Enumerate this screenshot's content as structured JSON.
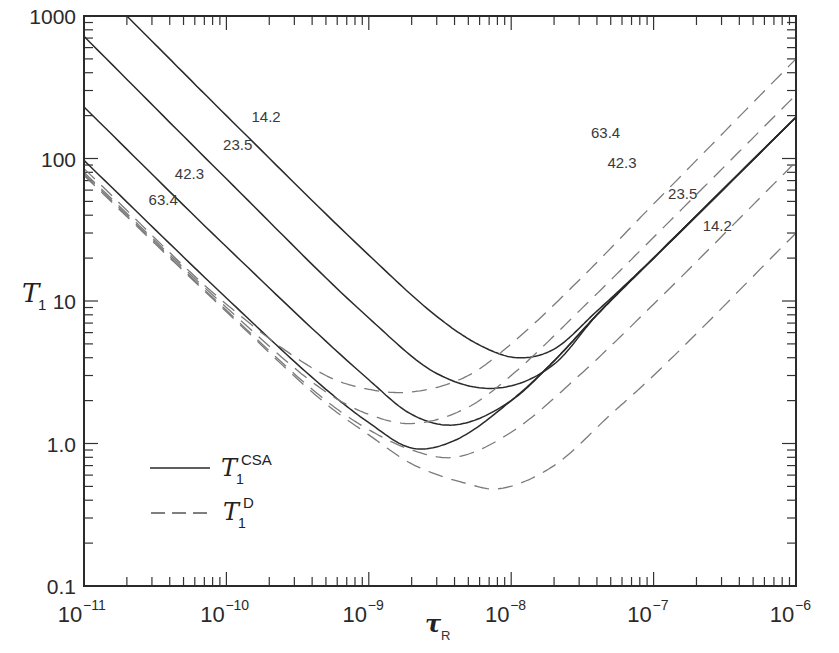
{
  "chart_data": {
    "type": "line",
    "title": "",
    "xlabel": "τ_R",
    "ylabel": "T_1",
    "xscale": "log",
    "yscale": "log",
    "xlim": [
      1e-11,
      1e-06
    ],
    "ylim": [
      0.1,
      1000
    ],
    "x_tick_labels": [
      "10^-11",
      "10^-10",
      "10^-9",
      "10^-8",
      "10^-7",
      "10^-6"
    ],
    "y_tick_labels": [
      "0.1",
      "1.0",
      "10",
      "100",
      "1000"
    ],
    "grid": false,
    "legend": {
      "position": "lower-left",
      "entries": [
        {
          "label": "T1^CSA",
          "style": "solid"
        },
        {
          "label": "T1^D",
          "style": "dashed"
        }
      ]
    },
    "series": [
      {
        "name": "T1^CSA 14.2",
        "style": "solid",
        "label": "14.2",
        "x": [
          2e-11,
          1e-10,
          1e-09,
          3e-09,
          6e-09,
          1.1e-08,
          2e-08,
          4e-08,
          1e-07,
          1e-06
        ],
        "y": [
          1000,
          200,
          21,
          7.8,
          4.9,
          4.0,
          4.6,
          8.5,
          20,
          195
        ]
      },
      {
        "name": "T1^CSA 23.5",
        "style": "solid",
        "label": "23.5",
        "x": [
          1e-11,
          1e-10,
          1e-09,
          3e-09,
          8e-09,
          2e-08,
          4e-08,
          1e-07,
          1e-06
        ],
        "y": [
          720,
          72,
          7.6,
          3.1,
          2.45,
          3.6,
          8.0,
          20,
          195
        ]
      },
      {
        "name": "T1^CSA 42.3",
        "style": "solid",
        "label": "42.3",
        "x": [
          1e-11,
          1e-10,
          1e-09,
          2e-09,
          4e-09,
          1e-08,
          2e-08,
          4e-08,
          1e-07,
          1e-06
        ],
        "y": [
          230,
          24,
          2.8,
          1.6,
          1.35,
          2.0,
          3.8,
          8.0,
          20,
          195
        ]
      },
      {
        "name": "T1^CSA 63.4",
        "style": "solid",
        "label": "63.4",
        "x": [
          1e-11,
          1e-10,
          5e-10,
          1e-09,
          2e-09,
          4e-09,
          1e-08,
          2e-08,
          4e-08,
          1e-07,
          1e-06
        ],
        "y": [
          97,
          10.5,
          2.4,
          1.4,
          0.93,
          1.05,
          2.0,
          3.8,
          8.0,
          20,
          195
        ]
      },
      {
        "name": "T1^D 63.4",
        "style": "dashed",
        "label": "63.4",
        "x": [
          1e-11,
          1e-10,
          5e-10,
          1e-09,
          2e-09,
          5e-09,
          1e-08,
          3e-08,
          1e-07,
          1e-06
        ],
        "y": [
          85,
          9.5,
          3.0,
          2.4,
          2.3,
          3.0,
          5.0,
          14,
          48,
          500
        ]
      },
      {
        "name": "T1^D 42.3",
        "style": "dashed",
        "label": "42.3",
        "x": [
          1e-11,
          1e-10,
          5e-10,
          1e-09,
          2e-09,
          5e-09,
          1e-08,
          3e-08,
          1e-07,
          1e-06
        ],
        "y": [
          80,
          9.0,
          2.3,
          1.6,
          1.38,
          1.8,
          3.0,
          8.5,
          28,
          280
        ]
      },
      {
        "name": "T1^D 23.5",
        "style": "dashed",
        "label": "23.5",
        "x": [
          1e-11,
          1e-10,
          5e-10,
          1e-09,
          2e-09,
          4e-09,
          1e-08,
          3e-08,
          1e-07,
          1e-06
        ],
        "y": [
          78,
          8.6,
          2.0,
          1.25,
          0.9,
          0.8,
          1.2,
          3.0,
          9.5,
          95
        ]
      },
      {
        "name": "T1^D 14.2",
        "style": "dashed",
        "label": "14.2",
        "x": [
          1e-11,
          1e-10,
          5e-10,
          1e-09,
          2e-09,
          5e-09,
          8e-09,
          2e-08,
          5e-08,
          1e-07,
          1e-06
        ],
        "y": [
          76,
          8.4,
          1.9,
          1.15,
          0.72,
          0.52,
          0.48,
          0.7,
          1.6,
          3.0,
          30
        ]
      }
    ],
    "annotations": [
      {
        "text": "14.2",
        "x": 1.9e-10,
        "y": 180
      },
      {
        "text": "23.5",
        "x": 1.2e-10,
        "y": 115
      },
      {
        "text": "42.3",
        "x": 5.5e-11,
        "y": 72
      },
      {
        "text": "63.4",
        "x": 3.6e-11,
        "y": 47
      },
      {
        "text": "63.4",
        "x": 4.6e-08,
        "y": 140
      },
      {
        "text": "42.3",
        "x": 6e-08,
        "y": 86
      },
      {
        "text": "23.5",
        "x": 1.6e-07,
        "y": 52
      },
      {
        "text": "14.2",
        "x": 2.8e-07,
        "y": 31
      }
    ]
  },
  "axis": {
    "y_title": "T",
    "y_title_sub": "1",
    "x_title": "τ",
    "x_title_sub": "R"
  },
  "legend": {
    "csa_main": "T",
    "csa_sub": "1",
    "csa_sup": "CSA",
    "d_main": "T",
    "d_sub": "1",
    "d_sup": "D"
  }
}
